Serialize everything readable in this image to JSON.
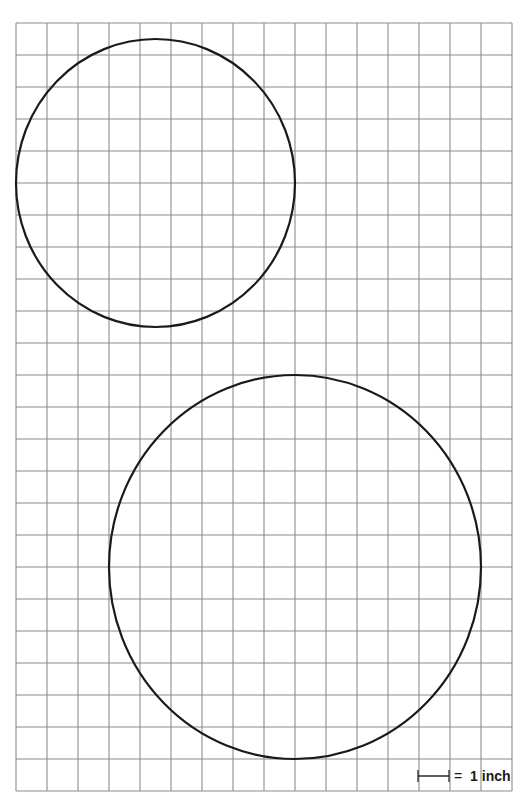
{
  "diagram": {
    "type": "grid-with-circles",
    "grid": {
      "columns": 16,
      "rows": 24,
      "line_color": "#8c8c8c"
    },
    "circles": [
      {
        "name": "small-circle",
        "center_grid": [
          4.5,
          5
        ],
        "radius_units": 4.5,
        "diameter_units": 9
      },
      {
        "name": "large-circle",
        "center_grid": [
          9,
          17
        ],
        "radius_units": 6,
        "diameter_units": 12
      }
    ],
    "scale": {
      "units": 1,
      "equals_text": "=",
      "label": "1 inch"
    },
    "stroke_color": "#1a1a1a"
  }
}
